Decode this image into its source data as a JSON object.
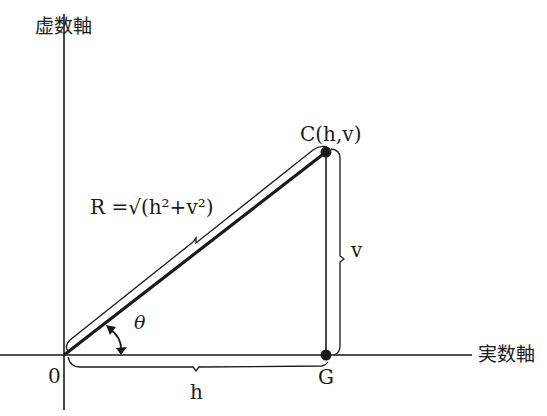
{
  "diagram": {
    "type": "complex-plane-vector",
    "axes": {
      "imaginary_label": "虚数軸",
      "real_label": "実数軸"
    },
    "points": {
      "origin": "0",
      "c": "C(h,v)",
      "g": "G"
    },
    "lengths": {
      "horizontal": "h",
      "vertical": "v",
      "angle": "θ",
      "magnitude_formula": "R =√(h²+v²)"
    },
    "colors": {
      "line": "#1a1a1a",
      "background": "#ffffff"
    }
  }
}
